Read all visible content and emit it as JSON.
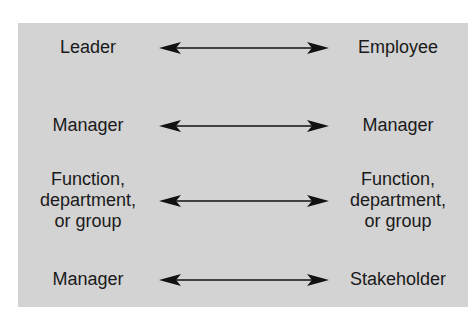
{
  "diagram": {
    "rows": [
      {
        "left": "Leader",
        "right": "Employee"
      },
      {
        "left": "Manager",
        "right": "Manager"
      },
      {
        "left": "Function,\ndepartment,\nor group",
        "right": "Function,\ndepartment,\nor group"
      },
      {
        "left": "Manager",
        "right": "Stakeholder"
      }
    ],
    "connector": "bidirectional-arrow"
  },
  "colors": {
    "panel": "#d3d3d3",
    "text": "#1a1a1a",
    "arrow": "#111111"
  }
}
